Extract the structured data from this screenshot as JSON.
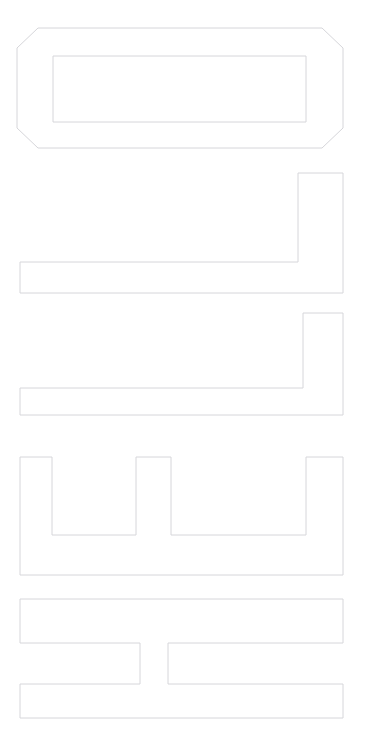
{
  "canvas": {
    "width": 365,
    "height": 749,
    "background_color": "#ffffff",
    "title": "Wireframe Outline Placeholders"
  },
  "style": {
    "stroke_color": "#d6d6da",
    "stroke_color_light": "#e2e2e6",
    "stroke_width": 1,
    "fill": "none",
    "texture": "dithered-noisy-thin-line"
  },
  "shapes": [
    {
      "id": "shape-1-chamfered-frame",
      "name": "chamfered-frame-outer",
      "label": "Chamfered frame with inner rectangle",
      "type": "octagon-chamfered-rect",
      "bounds": {
        "x": 16,
        "y": 27,
        "width": 328,
        "height": 122
      },
      "chamfer": 22,
      "points": "38,28 322,28 343,48 343,128 322,148 38,148 17,128 17,48"
    },
    {
      "id": "shape-1-inner-rect",
      "name": "chamfered-frame-inner",
      "label": "Inner rectangle",
      "type": "rect",
      "bounds": {
        "x": 53,
        "y": 56,
        "width": 253,
        "height": 66
      }
    },
    {
      "id": "shape-2-l-block",
      "name": "l-shape-block-upper",
      "label": "L shaped block upper",
      "type": "l-shape",
      "bounds": {
        "x": 19,
        "y": 172,
        "width": 325,
        "height": 122
      },
      "arm": {
        "vertical_x": 298,
        "vertical_width": 46,
        "horizontal_y": 262,
        "horizontal_height": 32
      },
      "points": "298,173 343,173 343,293 20,293 20,262 298,262"
    },
    {
      "id": "shape-3-l-block",
      "name": "l-shape-block-lower",
      "label": "L shaped block lower",
      "type": "l-shape",
      "bounds": {
        "x": 19,
        "y": 312,
        "width": 325,
        "height": 104
      },
      "arm": {
        "vertical_x": 303,
        "vertical_width": 41,
        "horizontal_y": 388,
        "horizontal_height": 28
      },
      "points": "303,313 343,313 343,415 20,415 20,388 303,388"
    },
    {
      "id": "shape-4-comb",
      "name": "comb-crenellated-block",
      "label": "Comb shaped block with two notches",
      "type": "crenellated",
      "bounds": {
        "x": 19,
        "y": 456,
        "width": 325,
        "height": 120
      },
      "prongs": [
        {
          "x": 20,
          "width": 33
        },
        {
          "x": 136,
          "width": 35
        },
        {
          "x": 306,
          "width": 38
        }
      ],
      "notch_bottom_y": 535,
      "base_bottom_y": 575,
      "points": "20,457 52,457 52,535 136,535 136,457 171,457 171,535 306,535 306,457 343,457 343,575 20,575"
    },
    {
      "id": "shape-5-zigzag",
      "name": "z-shape-block",
      "label": "Z shaped block with offset bars",
      "type": "z-shape",
      "bounds": {
        "x": 19,
        "y": 598,
        "width": 325,
        "height": 120
      },
      "segments": {
        "top_bar": {
          "x": 20,
          "y": 599,
          "width": 323,
          "height": 44
        },
        "left_column": {
          "x": 20,
          "y": 599,
          "width": 120,
          "height": 120
        },
        "right_column": {
          "x": 168,
          "y": 643,
          "width": 175,
          "height": 76
        },
        "bottom_bar": {
          "x": 20,
          "y": 684,
          "width": 323,
          "height": 34
        }
      },
      "gap_x_start": 140,
      "gap_x_end": 168,
      "points_left": "20,599 343,599 343,643 168,643 168,684 343,684 343,718 20,718 20,684 140,684 140,643 20,643"
    }
  ]
}
